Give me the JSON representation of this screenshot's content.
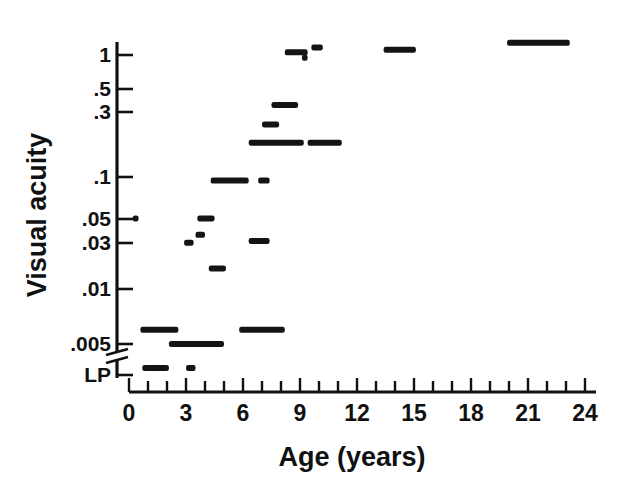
{
  "chart_data": {
    "type": "scatter",
    "title": "",
    "xlabel": "Age (years)",
    "ylabel": "Visual acuity",
    "xlim": [
      0,
      24
    ],
    "ylim_note": "log scale, LP (light perception) plotted below an axis break under .005",
    "grid": false,
    "legend": null,
    "marker_style": "horizontal dash; dash length encodes duration/span of the observation",
    "x_ticks_major": [
      0,
      3,
      6,
      9,
      12,
      15,
      18,
      21,
      24
    ],
    "x_ticks_minor_step": 1,
    "x_tick_labels": [
      "0",
      "3",
      "6",
      "9",
      "12",
      "15",
      "18",
      "21",
      "24"
    ],
    "y_ticks": [
      1,
      0.5,
      0.3,
      0.1,
      0.05,
      0.03,
      0.01,
      0.005
    ],
    "y_tick_labels": [
      "1",
      ".5",
      ".3",
      ".1",
      ".05",
      ".03",
      ".01",
      ".005",
      "LP"
    ],
    "y_special_label": "LP",
    "points": [
      {
        "x_start": 0.2,
        "x_end": 0.5,
        "y": 0.05,
        "label": "dot at age 0.3, acuity .05"
      },
      {
        "x_start": 0.6,
        "x_end": 2.6,
        "y": 0.0065,
        "label": "age 0.6-2.6, acuity ~.0065"
      },
      {
        "x_start": 0.7,
        "x_end": 2.1,
        "y": "LP",
        "label": "age 0.7-2.1, light perception"
      },
      {
        "x_start": 2.1,
        "x_end": 5.0,
        "y": 0.005,
        "label": "age 2.1-5.0, acuity .005"
      },
      {
        "x_start": 3.0,
        "x_end": 3.5,
        "y": "LP",
        "label": "age 3.0-3.5, light perception"
      },
      {
        "x_start": 2.9,
        "x_end": 3.4,
        "y": 0.032,
        "label": "age 2.9-3.4, acuity ~.032"
      },
      {
        "x_start": 3.5,
        "x_end": 4.0,
        "y": 0.037,
        "label": "age 3.5-4.0, acuity ~.037"
      },
      {
        "x_start": 3.6,
        "x_end": 4.5,
        "y": 0.05,
        "label": "age 3.6-4.5, acuity .05"
      },
      {
        "x_start": 4.2,
        "x_end": 5.1,
        "y": 0.02,
        "label": "age 4.2-5.1, acuity .02"
      },
      {
        "x_start": 4.3,
        "x_end": 6.3,
        "y": 0.1,
        "label": "age 4.3-6.3, acuity .1"
      },
      {
        "x_start": 5.8,
        "x_end": 8.2,
        "y": 0.0065,
        "label": "age 5.8-8.2, acuity ~.0065"
      },
      {
        "x_start": 6.3,
        "x_end": 7.4,
        "y": 0.033,
        "label": "age 6.3-7.4, acuity ~.033"
      },
      {
        "x_start": 6.8,
        "x_end": 7.4,
        "y": 0.1,
        "label": "age 6.8-7.4, acuity .1"
      },
      {
        "x_start": 6.3,
        "x_end": 9.2,
        "y": 0.2,
        "label": "age 6.3-9.2, acuity .2"
      },
      {
        "x_start": 7.0,
        "x_end": 7.9,
        "y": 0.28,
        "label": "age 7.0-7.9, acuity ~.28"
      },
      {
        "x_start": 7.5,
        "x_end": 8.9,
        "y": 0.4,
        "label": "age 7.5-8.9, acuity ~.4"
      },
      {
        "x_start": 8.2,
        "x_end": 9.4,
        "y": 1.05,
        "label": "age 8.2-9.4, acuity ~1.05"
      },
      {
        "x_start": 9.1,
        "x_end": 9.4,
        "y": 0.95,
        "label": "age ~9.3, acuity ~.95"
      },
      {
        "x_start": 9.6,
        "x_end": 10.2,
        "y": 1.15,
        "label": "age 9.6-10.2, acuity ~1.15"
      },
      {
        "x_start": 9.4,
        "x_end": 11.2,
        "y": 0.2,
        "label": "age 9.4-11.2, acuity .2"
      },
      {
        "x_start": 13.4,
        "x_end": 15.1,
        "y": 1.1,
        "label": "age 13.4-15.1, acuity ~1.1"
      },
      {
        "x_start": 19.9,
        "x_end": 23.2,
        "y": 1.25,
        "label": "age 19.9-23.2, acuity ~1.25"
      }
    ]
  },
  "axes": {
    "x_title": "Age (years)",
    "y_title": "Visual acuity",
    "y_labels": [
      "1",
      ".5",
      ".3",
      ".1",
      ".05",
      ".03",
      ".01",
      ".005",
      "LP"
    ],
    "x_labels": [
      "0",
      "3",
      "6",
      "9",
      "12",
      "15",
      "18",
      "21",
      "24"
    ]
  },
  "colors": {
    "ink": "#111111",
    "background": "#ffffff",
    "marker": "#141414"
  }
}
